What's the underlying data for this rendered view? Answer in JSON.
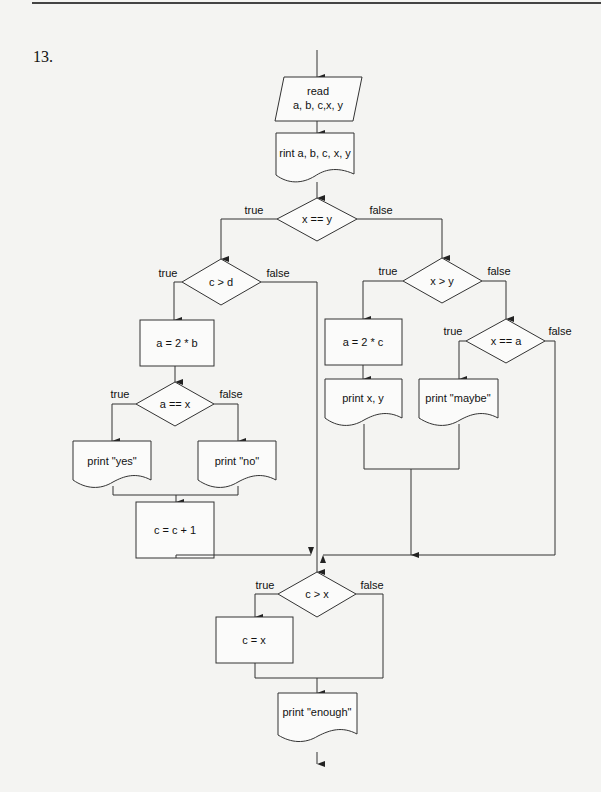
{
  "question": {
    "number": "13."
  },
  "flowchart": {
    "input": {
      "line1": "read",
      "line2": "a, b, c,x, y"
    },
    "print_initial": "rint a, b, c, x, y",
    "decision_xy_equal": {
      "label": "x == y",
      "true": "true",
      "false": "false"
    },
    "decision_c_gt_d": {
      "label": "c > d",
      "true": "true",
      "false": "false"
    },
    "assign_a_2b": "a = 2 * b",
    "decision_a_eq_x": {
      "label": "a == x",
      "true": "true",
      "false": "false"
    },
    "print_yes": "print \"yes\"",
    "print_no": "print \"no\"",
    "increment_c": "c = c + 1",
    "decision_x_gt_y": {
      "label": "x > y",
      "true": "true",
      "false": "false"
    },
    "assign_a_2c": "a = 2 * c",
    "print_xy": "print x, y",
    "decision_x_eq_a": {
      "label": "x == a",
      "true": "true",
      "false": "false"
    },
    "print_maybe": "print \"maybe\"",
    "decision_c_gt_x": {
      "label": "c > x",
      "true": "true",
      "false": "false"
    },
    "assign_c_x": "c = x",
    "print_enough": "print \"enough\""
  }
}
